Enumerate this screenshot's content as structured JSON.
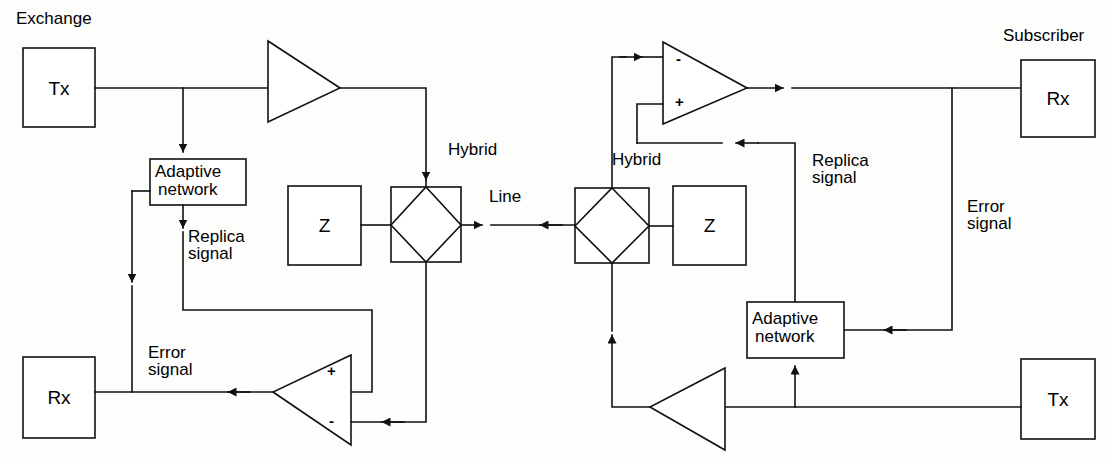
{
  "diagram": {
    "side_labels": {
      "exchange": "Exchange",
      "subscriber": "Subscriber"
    },
    "colors": {
      "stroke": "#111111",
      "fill": "#ffffff",
      "background": "#fdfdfb"
    },
    "blocks": [
      {
        "id": "tx-left",
        "label": "Tx",
        "x": 23,
        "y": 48,
        "w": 72,
        "h": 79
      },
      {
        "id": "adaptive-left",
        "label": "Adaptive\nnetwork",
        "line1": "Adaptive",
        "line2": "network",
        "x": 150,
        "y": 159,
        "w": 96,
        "h": 46
      },
      {
        "id": "z-left",
        "label": "Z",
        "x": 288,
        "y": 186,
        "w": 73,
        "h": 79
      },
      {
        "id": "rx-left",
        "label": "Rx",
        "x": 23,
        "y": 357,
        "w": 72,
        "h": 81
      },
      {
        "id": "z-right",
        "label": "Z",
        "x": 673,
        "y": 186,
        "w": 73,
        "h": 79
      },
      {
        "id": "adaptive-right",
        "label": "Adaptive\nnetwork",
        "line1": "Adaptive",
        "line2": "network",
        "x": 747,
        "y": 302,
        "w": 97,
        "h": 56
      },
      {
        "id": "rx-right",
        "label": "Rx",
        "x": 1021,
        "y": 60,
        "w": 74,
        "h": 77
      },
      {
        "id": "tx-right",
        "label": "Tx",
        "x": 1021,
        "y": 359,
        "w": 74,
        "h": 80
      }
    ],
    "hybrids": [
      {
        "id": "hybrid-left",
        "label": "Hybrid",
        "x": 391,
        "y": 187,
        "w": 70,
        "h": 75
      },
      {
        "id": "hybrid-right",
        "label": "Hybrid",
        "x": 575,
        "y": 188,
        "w": 74,
        "h": 75
      }
    ],
    "amplifiers": [
      {
        "id": "amp-left-top",
        "direction": "right",
        "x": 268,
        "y": 41,
        "w": 72,
        "h": 81
      },
      {
        "id": "amp-right-bottom",
        "direction": "left",
        "x": 650,
        "y": 368,
        "w": 75,
        "h": 82
      }
    ],
    "subtractors": [
      {
        "id": "subtractor-left",
        "direction": "left",
        "plus": "+",
        "minus": "-",
        "x": 273,
        "y": 355,
        "w": 78,
        "h": 90
      },
      {
        "id": "subtractor-right",
        "direction": "right",
        "minus": "-",
        "plus": "+",
        "x": 663,
        "y": 42,
        "w": 84,
        "h": 82
      }
    ],
    "annotations": [
      {
        "id": "line-label",
        "text": "Line",
        "x": 489,
        "y": 188
      },
      {
        "id": "hybrid-left-label",
        "text": "Hybrid",
        "x": 448,
        "y": 141
      },
      {
        "id": "hybrid-right-label",
        "text": "Hybrid",
        "x": 612,
        "y": 151
      },
      {
        "id": "replica-left-l1",
        "text": "Replica",
        "x": 188,
        "y": 236
      },
      {
        "id": "replica-left-l2",
        "text": "signal",
        "x": 188,
        "y": 253
      },
      {
        "id": "error-left-l1",
        "text": "Error",
        "x": 148,
        "y": 350
      },
      {
        "id": "error-left-l2",
        "text": "signal",
        "x": 148,
        "y": 367
      },
      {
        "id": "replica-right-l1",
        "text": "Replica",
        "x": 812,
        "y": 158
      },
      {
        "id": "replica-right-l2",
        "text": "signal",
        "x": 812,
        "y": 175
      },
      {
        "id": "error-right-l1",
        "text": "Error",
        "x": 967,
        "y": 204
      },
      {
        "id": "error-right-l2",
        "text": "signal",
        "x": 967,
        "y": 221
      }
    ]
  }
}
